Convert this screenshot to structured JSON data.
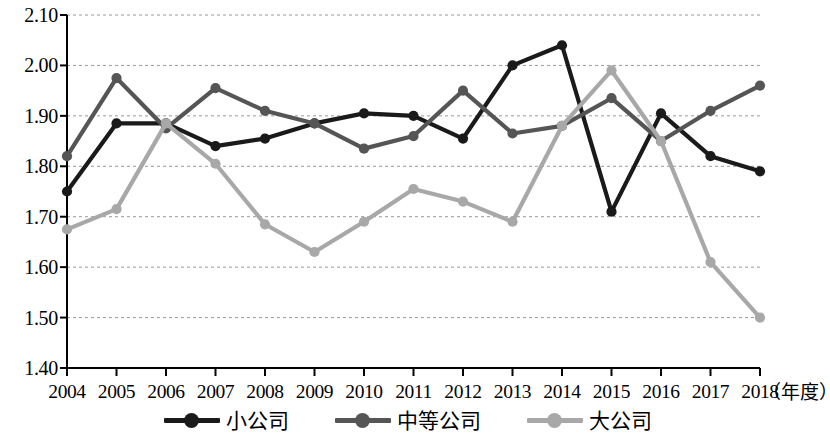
{
  "chart_data": {
    "type": "line",
    "title": "",
    "subtitle": "",
    "xlabel": "（年度）",
    "ylabel": "",
    "x": [
      2004,
      2005,
      2006,
      2007,
      2008,
      2009,
      2010,
      2011,
      2012,
      2013,
      2014,
      2015,
      2016,
      2017,
      2018
    ],
    "categories": [
      "2004",
      "2005",
      "2006",
      "2007",
      "2008",
      "2009",
      "2010",
      "2011",
      "2012",
      "2013",
      "2014",
      "2015",
      "2016",
      "2017",
      "2018"
    ],
    "xlim": [
      2004,
      2018
    ],
    "ylim": [
      1.4,
      2.1
    ],
    "yticks": [
      1.4,
      1.5,
      1.6,
      1.7,
      1.8,
      1.9,
      2.0,
      2.1
    ],
    "ytick_labels": [
      "1.40",
      "1.50",
      "1.60",
      "1.70",
      "1.80",
      "1.90",
      "2.00",
      "2.10"
    ],
    "grid": "horizontal-dashed",
    "legend_position": "bottom-center",
    "series": [
      {
        "name": "小公司",
        "color": "#1a1a1a",
        "marker": "circle",
        "values": [
          1.75,
          1.885,
          1.885,
          1.84,
          1.855,
          1.885,
          1.905,
          1.9,
          1.855,
          2.0,
          2.04,
          1.71,
          1.905,
          1.82,
          1.79
        ]
      },
      {
        "name": "中等公司",
        "color": "#555555",
        "marker": "circle",
        "values": [
          1.82,
          1.975,
          1.875,
          1.955,
          1.91,
          1.885,
          1.835,
          1.86,
          1.95,
          1.865,
          1.88,
          1.935,
          1.85,
          1.91,
          1.96
        ]
      },
      {
        "name": "大公司",
        "color": "#a8a8a8",
        "marker": "circle",
        "values": [
          1.675,
          1.715,
          1.885,
          1.805,
          1.685,
          1.63,
          1.69,
          1.755,
          1.73,
          1.69,
          1.88,
          1.99,
          1.85,
          1.61,
          1.5
        ]
      }
    ]
  },
  "legend": {
    "items": [
      {
        "label": "小公司",
        "color": "#1a1a1a"
      },
      {
        "label": "中等公司",
        "color": "#555555"
      },
      {
        "label": "大公司",
        "color": "#a8a8a8"
      }
    ]
  },
  "axis": {
    "x_unit_label": "（年度）"
  }
}
